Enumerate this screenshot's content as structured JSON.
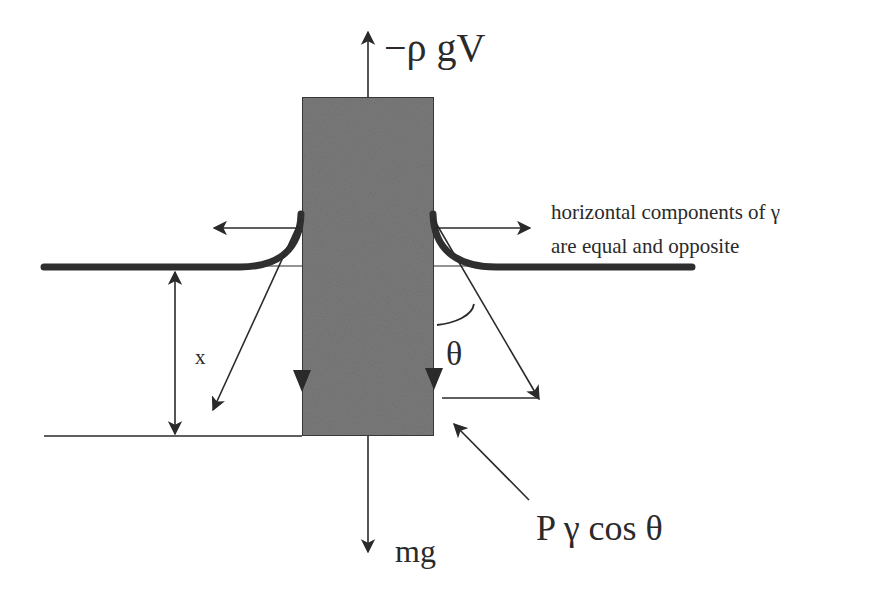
{
  "diagram": {
    "type": "force-diagram",
    "colors": {
      "background": "#ffffff",
      "ink": "#2a2a2a",
      "body_fill": "#7a7a7a",
      "surface_line": "#2f2f2f"
    },
    "labels": {
      "buoyancy": "−ρ gV",
      "weight": "mg",
      "tension_note_line1": "horizontal components of γ",
      "tension_note_line2": "are equal and opposite",
      "immersion_depth": "x",
      "contact_angle": "θ",
      "vertical_tension": "P γ cos θ"
    },
    "elements": [
      {
        "id": "immersed-body",
        "shape": "rectangle",
        "x": 302,
        "y": 97,
        "w": 132,
        "h": 339
      },
      {
        "id": "buoyancy-arrow",
        "direction": "up",
        "from": [
          368,
          97
        ],
        "to": [
          368,
          45
        ]
      },
      {
        "id": "weight-arrow",
        "direction": "down",
        "from": [
          368,
          436
        ],
        "to": [
          368,
          550
        ]
      },
      {
        "id": "left-horizontal-tension",
        "direction": "left",
        "from": [
          300,
          228
        ],
        "to": [
          216,
          228
        ]
      },
      {
        "id": "right-horizontal-tension",
        "direction": "right",
        "from": [
          434,
          228
        ],
        "to": [
          528,
          228
        ]
      },
      {
        "id": "left-tension-vector",
        "direction": "down-left",
        "from": [
          300,
          218
        ],
        "to": [
          214,
          408
        ]
      },
      {
        "id": "right-tension-vector",
        "direction": "down-right",
        "from": [
          434,
          218
        ],
        "to": [
          538,
          398
        ]
      },
      {
        "id": "depth-dimension",
        "direction": "vertical-double",
        "from": [
          175,
          268
        ],
        "to": [
          175,
          436
        ]
      },
      {
        "id": "vertical-tension-pointer",
        "direction": "up-left",
        "from": [
          528,
          500
        ],
        "to": [
          455,
          424
        ]
      }
    ]
  }
}
